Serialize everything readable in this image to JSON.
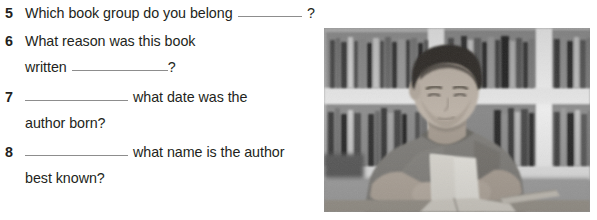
{
  "worksheet": {
    "questions": [
      {
        "number": "5",
        "lines": [
          {
            "segments": [
              {
                "type": "text",
                "value": "Which book group do you belong"
              },
              {
                "type": "blank",
                "size": "long"
              },
              {
                "type": "text",
                "value": "?"
              }
            ]
          }
        ]
      },
      {
        "number": "6",
        "lines": [
          {
            "segments": [
              {
                "type": "text",
                "value": "What reason was this book"
              }
            ]
          },
          {
            "segments": [
              {
                "type": "text",
                "value": "written"
              },
              {
                "type": "blank",
                "size": "mid"
              },
              {
                "type": "text",
                "value": "?"
              }
            ]
          }
        ]
      },
      {
        "number": "7",
        "lines": [
          {
            "segments": [
              {
                "type": "blank",
                "size": "long"
              },
              {
                "type": "text",
                "value": "what date was the"
              }
            ]
          },
          {
            "segments": [
              {
                "type": "text",
                "value": "author born?"
              }
            ]
          }
        ]
      },
      {
        "number": "8",
        "lines": [
          {
            "segments": [
              {
                "type": "blank",
                "size": "long"
              },
              {
                "type": "text",
                "value": "what name is the author"
              }
            ]
          },
          {
            "segments": [
              {
                "type": "text",
                "value": "best known?"
              }
            ]
          }
        ]
      }
    ]
  },
  "photo": {
    "alt": "Black and white photograph of a boy reading a book at a table in a library with tall bookshelves behind him",
    "subject": "boy-reading-in-library",
    "palette": {
      "shelf_light": "#d9d9d9",
      "shelf_frame": "#ebebeb",
      "books_dark": "#3a3a3a",
      "books_mid": "#6e6e6e",
      "skin": "#b9b0a6",
      "hair": "#2e2a27",
      "shirt": "#7d7a75",
      "page": "#e6e4de",
      "table": "#9a958d",
      "background": "#9b9b9b"
    }
  }
}
